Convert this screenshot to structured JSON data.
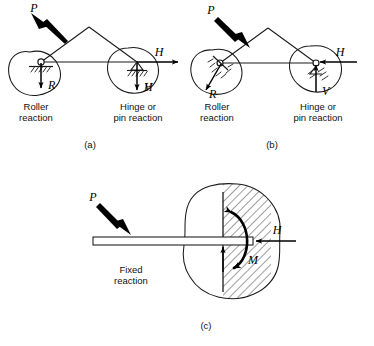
{
  "figure": {
    "background_color": "#ffffff",
    "ink_color": "#1a1a1a"
  },
  "panels": [
    {
      "id": "a",
      "caption": "(a)",
      "description": "Triangular frame on roller and pin supports with applied load directed up and to the left",
      "load": {
        "symbol": "P",
        "direction": "up-left"
      },
      "supports": [
        {
          "kind": "roller",
          "label_line1": "Roller",
          "label_line2": "reaction",
          "reactions": [
            {
              "symbol": "R",
              "direction": "down"
            }
          ]
        },
        {
          "kind": "hinge-pin",
          "label_line1": "Hinge or",
          "label_line2": "pin reaction",
          "reactions": [
            {
              "symbol": "H",
              "direction": "right"
            },
            {
              "symbol": "V",
              "direction": "down"
            }
          ]
        }
      ]
    },
    {
      "id": "b",
      "caption": "(b)",
      "description": "Same triangular frame with load directed down and to the right, producing reversed reactions",
      "load": {
        "symbol": "P",
        "direction": "down-right"
      },
      "supports": [
        {
          "kind": "roller",
          "label_line1": "Roller",
          "label_line2": "reaction",
          "reactions": [
            {
              "symbol": "R",
              "direction": "down-left"
            }
          ]
        },
        {
          "kind": "hinge-pin",
          "label_line1": "Hinge or",
          "label_line2": "pin reaction",
          "reactions": [
            {
              "symbol": "H",
              "direction": "left"
            },
            {
              "symbol": "V",
              "direction": "up"
            }
          ]
        }
      ]
    },
    {
      "id": "c",
      "caption": "(c)",
      "description": "Cantilever beam built into a hatched wall, loaded downward at the free end",
      "load": {
        "symbol": "P",
        "direction": "down-right"
      },
      "supports": [
        {
          "kind": "fixed",
          "label_line1": "Fixed",
          "label_line2": "reaction",
          "reactions": [
            {
              "symbol": "H",
              "direction": "left"
            },
            {
              "symbol": "V",
              "direction": "up"
            },
            {
              "symbol": "M",
              "direction": "counterclockwise-moment"
            }
          ]
        }
      ]
    }
  ]
}
